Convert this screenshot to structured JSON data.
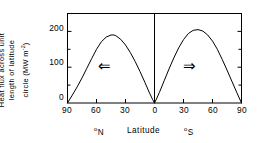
{
  "chart_data": {
    "type": "line",
    "title": "",
    "subtitle": "",
    "ylabel_lines": [
      "Heat flux across unit",
      "length of latitude",
      "circle (MW m"
    ],
    "ylabel_units_exponent": "-2",
    "ylabel_units_tail": ")",
    "ylabel_full": "Heat flux across unit length of latitude circle (MW m-2)",
    "xlabel_left": "N",
    "xlabel_center": "Latitude",
    "xlabel_right": "S",
    "xlabel_degree": "o",
    "xlabel_full": "oN   Latitude   oS",
    "yticks": [
      0,
      100,
      200
    ],
    "ytick_labels": [
      "0",
      "100",
      "200"
    ],
    "ylim": [
      0,
      250
    ],
    "xticks": [
      -90,
      -60,
      -30,
      0,
      30,
      60,
      90
    ],
    "xtick_labels": [
      "90",
      "60",
      "30",
      "0",
      "30",
      "60",
      "90"
    ],
    "xlim": [
      -90,
      90
    ],
    "grid": false,
    "legend": "none",
    "x_axis_note": "negative x = degrees North (left half), positive x = degrees South (right half)",
    "annotations": [
      {
        "text": "left-arrow",
        "glyph": "⇐",
        "x": -45,
        "y": 85,
        "meaning": "northward heat transport"
      },
      {
        "text": "right-arrow",
        "glyph": "⇒",
        "x": 45,
        "y": 85,
        "meaning": "southward heat transport"
      }
    ],
    "center_divider_x": 0,
    "series": [
      {
        "name": "Northern hemisphere heat flux",
        "peak_value": 190,
        "peak_latitude": "48 N",
        "x": [
          -90,
          -85,
          -80,
          -75,
          -70,
          -65,
          -60,
          -55,
          -50,
          -45,
          -42,
          -40,
          -35,
          -30,
          -25,
          -20,
          -15,
          -10,
          -5,
          -2,
          0
        ],
        "values": [
          0,
          22,
          45,
          70,
          97,
          124,
          150,
          171,
          184,
          190,
          190,
          188,
          178,
          162,
          141,
          116,
          88,
          58,
          27,
          10,
          0
        ]
      },
      {
        "name": "Southern hemisphere heat flux",
        "peak_value": 205,
        "peak_latitude": "45 S",
        "x": [
          0,
          2,
          5,
          10,
          15,
          20,
          25,
          30,
          35,
          40,
          45,
          50,
          55,
          60,
          65,
          70,
          75,
          80,
          85,
          90
        ],
        "values": [
          0,
          11,
          29,
          62,
          95,
          126,
          154,
          177,
          194,
          203,
          205,
          201,
          190,
          173,
          150,
          122,
          92,
          61,
          30,
          0
        ]
      }
    ],
    "colors": {
      "line": "#000000",
      "frame": "#000000",
      "background": "#ffffff",
      "text": "#000000"
    }
  }
}
